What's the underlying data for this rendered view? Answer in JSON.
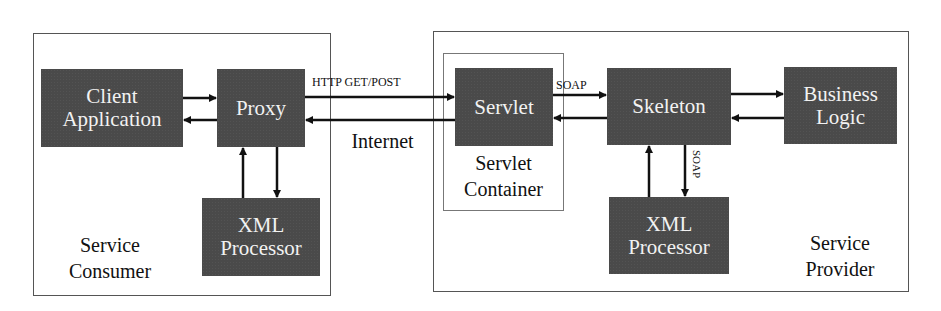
{
  "diagram": {
    "consumer": {
      "label_line1": "Service",
      "label_line2": "Consumer",
      "nodes": {
        "client_line1": "Client",
        "client_line2": "Application",
        "proxy": "Proxy",
        "xml_line1": "XML",
        "xml_line2": "Processor"
      }
    },
    "network": {
      "protocol_label": "HTTP GET/POST",
      "internet_label": "Internet"
    },
    "provider": {
      "label_line1": "Service",
      "label_line2": "Provider",
      "container": {
        "label_line1": "Servlet",
        "label_line2": "Container"
      },
      "nodes": {
        "servlet": "Servlet",
        "skeleton": "Skeleton",
        "business_line1": "Business",
        "business_line2": "Logic",
        "xml_line1": "XML",
        "xml_line2": "Processor"
      },
      "soap_label_horizontal": "SOAP",
      "soap_label_vertical": "SOAP"
    },
    "colors": {
      "node_fill": "#4a4a4a",
      "node_text": "#f2f2f2",
      "line": "#111111",
      "frame": "#555555"
    }
  }
}
